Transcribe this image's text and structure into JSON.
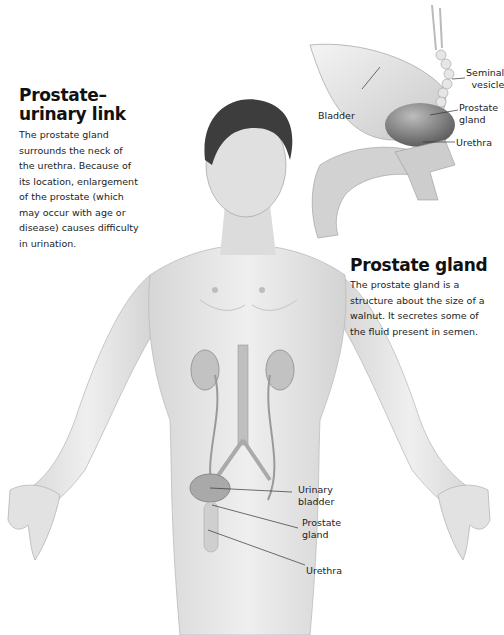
{
  "left_panel": {
    "heading_line1": "Prostate–",
    "heading_line2": "urinary link",
    "body_lines": [
      "The prostate gland",
      "surrounds the neck of",
      "the urethra. Because of",
      "its location, enlargement",
      "of the prostate (which",
      "may occur with age or",
      "disease) causes difficulty",
      "in urination."
    ]
  },
  "right_panel": {
    "heading": "Prostate gland",
    "body_lines": [
      "The prostate gland is a",
      "structure about the size of a",
      "walnut. It secretes some of",
      "the fluid present in semen."
    ]
  },
  "inset_labels": {
    "seminal_vesicle_1": "Seminal",
    "seminal_vesicle_2": "vesicle",
    "bladder": "Bladder",
    "prostate_1": "Prostate",
    "prostate_2": "gland",
    "urethra": "Urethra"
  },
  "body_labels": {
    "urinary_bladder_1": "Urinary",
    "urinary_bladder_2": "bladder",
    "prostate_1": "Prostate",
    "prostate_2": "gland",
    "urethra": "Urethra"
  },
  "colors": {
    "skin": "#e8e8e8",
    "skin_shade": "#cfcfcf",
    "organ": "#b9b9b9",
    "prostate_dark": "#6a6a6a",
    "leader_line": "#333333"
  }
}
